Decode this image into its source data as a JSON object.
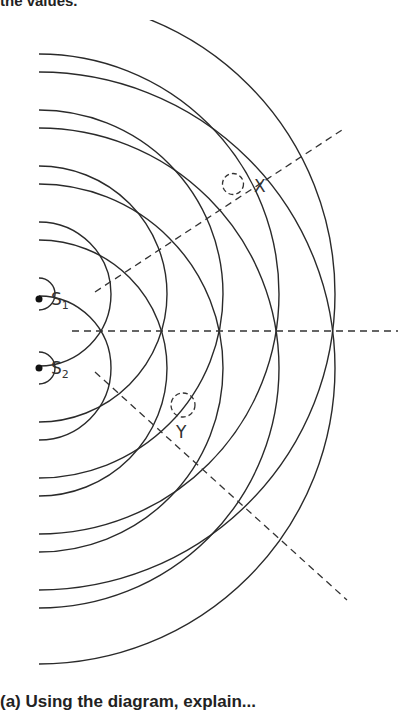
{
  "header": {
    "text": "the values."
  },
  "footer": {
    "text": "(a) Using the diagram, explain..."
  },
  "diagram": {
    "sources": [
      {
        "id": "S1",
        "label": "S",
        "subscript": "1",
        "x": 39,
        "y": 294
      },
      {
        "id": "S2",
        "label": "S",
        "subscript": "2",
        "x": 39,
        "y": 368
      }
    ],
    "wavefront_radii": [
      16,
      72,
      128,
      184,
      240,
      296
    ],
    "points": [
      {
        "id": "X",
        "label": "X",
        "x": 233,
        "y": 184
      },
      {
        "id": "Y",
        "label": "Y",
        "x": 183,
        "y": 405
      }
    ],
    "line_color": "#2a2a2a"
  }
}
